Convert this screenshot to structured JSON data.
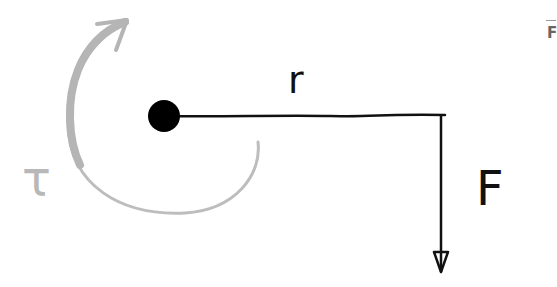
{
  "diagram": {
    "labels": {
      "radius": "r",
      "force": "F",
      "torque": "τ",
      "corner_fragment": "F"
    },
    "colors": {
      "stroke": "#111111",
      "torque_arrow": "#b8b8b8",
      "pivot": "#000000",
      "background": "#ffffff"
    },
    "elements": [
      {
        "id": "pivot",
        "type": "dot",
        "cx": 164,
        "cy": 116,
        "r": 16
      },
      {
        "id": "lever-arm",
        "type": "line",
        "from": [
          164,
          116
        ],
        "to": [
          445,
          116
        ],
        "label": "r"
      },
      {
        "id": "force-arrow",
        "type": "arrow",
        "from": [
          441,
          116
        ],
        "to": [
          441,
          272
        ],
        "direction": "down",
        "label": "F"
      },
      {
        "id": "torque-arc",
        "type": "curved-arrow",
        "direction": "counterclockwise-to-top",
        "label": "τ"
      }
    ]
  }
}
